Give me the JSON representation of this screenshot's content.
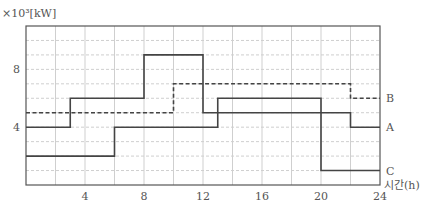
{
  "chart_data": {
    "type": "line",
    "step": true,
    "title": "",
    "ylabel": "×10³[kW]",
    "xlabel": "시간(h)",
    "xlim": [
      0,
      24
    ],
    "ylim": [
      0,
      11
    ],
    "xticks": [
      4,
      8,
      12,
      16,
      20,
      24
    ],
    "yticks": [
      4,
      8
    ],
    "x_grid_step": 2,
    "y_grid_step": 1,
    "grid": true,
    "legend_position": "right-end-labels",
    "series": [
      {
        "name": "A",
        "style": "solid",
        "steps": [
          {
            "x0": 0,
            "x1": 3,
            "y": 4
          },
          {
            "x0": 3,
            "x1": 8,
            "y": 6
          },
          {
            "x0": 8,
            "x1": 12,
            "y": 9
          },
          {
            "x0": 12,
            "x1": 22,
            "y": 5
          },
          {
            "x0": 22,
            "x1": 24,
            "y": 4
          }
        ]
      },
      {
        "name": "B",
        "style": "dashed",
        "steps": [
          {
            "x0": 0,
            "x1": 10,
            "y": 5
          },
          {
            "x0": 10,
            "x1": 22,
            "y": 7
          },
          {
            "x0": 22,
            "x1": 24,
            "y": 6
          }
        ]
      },
      {
        "name": "C",
        "style": "solid",
        "steps": [
          {
            "x0": 0,
            "x1": 6,
            "y": 2
          },
          {
            "x0": 6,
            "x1": 13,
            "y": 4
          },
          {
            "x0": 13,
            "x1": 20,
            "y": 6
          },
          {
            "x0": 20,
            "x1": 24,
            "y": 1
          }
        ]
      }
    ]
  },
  "colors": {
    "line": "#444444",
    "grid": "#cfcfcf",
    "axis": "#555555",
    "text": "#555555"
  }
}
